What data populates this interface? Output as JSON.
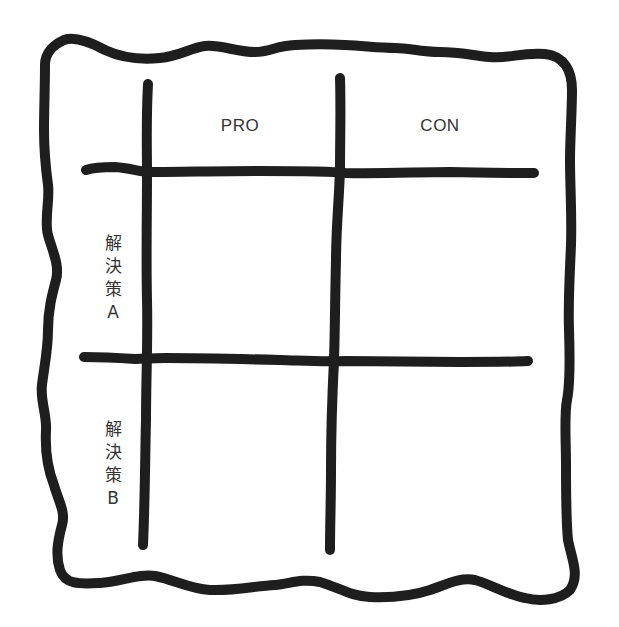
{
  "diagram": {
    "type": "pro-con-matrix",
    "stroke_color": "#1e1e1e",
    "text_color": "#333333",
    "background": "#ffffff",
    "columns": [
      {
        "label": "PRO"
      },
      {
        "label": "CON"
      }
    ],
    "rows": [
      {
        "label": "解決策A",
        "chars": [
          "解",
          "決",
          "策",
          "A"
        ]
      },
      {
        "label": "解決策B",
        "chars": [
          "解",
          "決",
          "策",
          "B"
        ]
      }
    ],
    "cells": [
      [
        "",
        ""
      ],
      [
        "",
        ""
      ]
    ]
  }
}
